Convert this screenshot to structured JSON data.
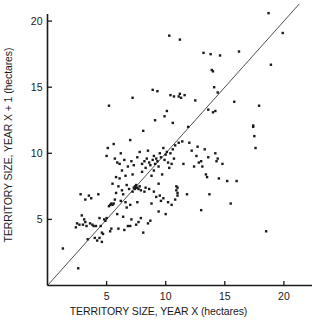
{
  "chart_data": {
    "type": "scatter",
    "title": "",
    "xlabel": "TERRITORY SIZE, YEAR X (hectares)",
    "ylabel": "TERRITORY SIZE, YEAR X + 1 (hectares)",
    "xlim": [
      0,
      22.8
    ],
    "ylim": [
      0,
      21.5
    ],
    "xticks": [
      5,
      10,
      15,
      20
    ],
    "yticks": [
      5,
      10,
      15,
      20
    ],
    "xtick_labels": [
      "5",
      "10",
      "15",
      "20"
    ],
    "ytick_labels": [
      "5",
      "10",
      "15",
      "20"
    ],
    "grid": false,
    "legend": false,
    "marker": {
      "shape": "square",
      "size_px": 2.4,
      "color": "#1a1a1a"
    },
    "reference_line": {
      "label": "y = x",
      "type": "identity",
      "from": [
        0,
        0
      ],
      "to": [
        21.3,
        21.3
      ],
      "color": "#3c3c3c",
      "width_px": 0.9
    },
    "axis_color": "#1a1a1a",
    "background": "#ffffff",
    "n_points": 205,
    "points": [
      [
        1.3,
        2.8
      ],
      [
        2.6,
        1.3
      ],
      [
        2.4,
        4.4
      ],
      [
        2.5,
        4.7
      ],
      [
        2.7,
        4.6
      ],
      [
        2.8,
        6.9
      ],
      [
        2.9,
        5.3
      ],
      [
        3.0,
        4.6
      ],
      [
        3.1,
        5.0
      ],
      [
        3.2,
        6.5
      ],
      [
        3.3,
        4.5
      ],
      [
        3.4,
        3.5
      ],
      [
        3.5,
        6.8
      ],
      [
        3.6,
        4.7
      ],
      [
        3.7,
        6.6
      ],
      [
        3.8,
        4.6
      ],
      [
        3.9,
        4.5
      ],
      [
        4.0,
        3.6
      ],
      [
        4.1,
        4.5
      ],
      [
        4.2,
        3.4
      ],
      [
        4.3,
        6.9
      ],
      [
        4.4,
        3.6
      ],
      [
        4.5,
        4.5
      ],
      [
        4.6,
        3.3
      ],
      [
        4.7,
        3.9
      ],
      [
        4.8,
        5.0
      ],
      [
        4.9,
        4.9
      ],
      [
        5.0,
        5.1
      ],
      [
        5.0,
        9.8
      ],
      [
        5.1,
        10.4
      ],
      [
        5.2,
        6.0
      ],
      [
        5.2,
        13.6
      ],
      [
        5.3,
        6.1
      ],
      [
        5.4,
        6.2
      ],
      [
        5.4,
        4.3
      ],
      [
        5.5,
        6.1
      ],
      [
        5.5,
        7.7
      ],
      [
        5.6,
        6.2
      ],
      [
        5.6,
        10.7
      ],
      [
        5.7,
        9.6
      ],
      [
        5.8,
        8.2
      ],
      [
        5.8,
        7.0
      ],
      [
        5.9,
        9.3
      ],
      [
        5.9,
        5.4
      ],
      [
        6.0,
        7.5
      ],
      [
        6.0,
        4.3
      ],
      [
        6.1,
        9.2
      ],
      [
        6.1,
        8.1
      ],
      [
        6.2,
        6.4
      ],
      [
        6.2,
        10.0
      ],
      [
        6.3,
        8.7
      ],
      [
        6.3,
        7.2
      ],
      [
        6.4,
        5.2
      ],
      [
        6.5,
        4.2
      ],
      [
        6.5,
        9.5
      ],
      [
        6.6,
        8.3
      ],
      [
        6.6,
        6.3
      ],
      [
        6.7,
        7.6
      ],
      [
        6.8,
        4.5
      ],
      [
        6.8,
        9.0
      ],
      [
        6.9,
        7.3
      ],
      [
        7.0,
        6.1
      ],
      [
        7.0,
        11.0
      ],
      [
        7.1,
        9.4
      ],
      [
        7.1,
        5.0
      ],
      [
        7.2,
        8.4
      ],
      [
        7.2,
        14.2
      ],
      [
        7.3,
        7.4
      ],
      [
        7.3,
        9.1
      ],
      [
        7.4,
        7.3
      ],
      [
        7.4,
        7.5
      ],
      [
        7.5,
        7.4
      ],
      [
        7.5,
        7.6
      ],
      [
        7.5,
        4.6
      ],
      [
        7.6,
        7.4
      ],
      [
        7.6,
        9.7
      ],
      [
        7.7,
        7.3
      ],
      [
        7.7,
        4.8
      ],
      [
        7.8,
        7.5
      ],
      [
        7.8,
        10.1
      ],
      [
        7.9,
        7.2
      ],
      [
        7.9,
        5.1
      ],
      [
        8.0,
        9.2
      ],
      [
        8.0,
        8.6
      ],
      [
        8.1,
        4.0
      ],
      [
        8.1,
        11.7
      ],
      [
        8.2,
        9.4
      ],
      [
        8.3,
        8.9
      ],
      [
        8.3,
        7.4
      ],
      [
        8.4,
        9.6
      ],
      [
        8.5,
        10.2
      ],
      [
        8.5,
        4.7
      ],
      [
        8.6,
        9.3
      ],
      [
        8.7,
        4.9
      ],
      [
        8.7,
        9.1
      ],
      [
        8.8,
        6.2
      ],
      [
        8.9,
        9.5
      ],
      [
        8.9,
        14.8
      ],
      [
        9.0,
        9.8
      ],
      [
        9.0,
        8.7
      ],
      [
        9.1,
        9.2
      ],
      [
        9.1,
        12.5
      ],
      [
        9.2,
        9.6
      ],
      [
        9.2,
        6.7
      ],
      [
        9.3,
        9.4
      ],
      [
        9.3,
        14.7
      ],
      [
        9.4,
        9.0
      ],
      [
        9.4,
        5.6
      ],
      [
        9.5,
        10.0
      ],
      [
        9.5,
        6.8
      ],
      [
        9.6,
        9.7
      ],
      [
        9.6,
        6.4
      ],
      [
        9.7,
        8.4
      ],
      [
        9.8,
        10.4
      ],
      [
        9.8,
        6.6
      ],
      [
        9.9,
        9.5
      ],
      [
        9.9,
        12.8
      ],
      [
        10.0,
        9.9
      ],
      [
        10.0,
        5.4
      ],
      [
        10.1,
        10.1
      ],
      [
        10.1,
        13.2
      ],
      [
        10.2,
        9.3
      ],
      [
        10.2,
        6.3
      ],
      [
        10.3,
        18.9
      ],
      [
        10.4,
        10.0
      ],
      [
        10.4,
        14.4
      ],
      [
        10.5,
        6.1
      ],
      [
        10.6,
        10.3
      ],
      [
        10.6,
        12.3
      ],
      [
        10.7,
        14.3
      ],
      [
        10.7,
        9.6
      ],
      [
        10.8,
        10.6
      ],
      [
        10.8,
        6.5
      ],
      [
        10.9,
        7.2
      ],
      [
        10.9,
        7.5
      ],
      [
        11.0,
        7.0
      ],
      [
        11.0,
        7.4
      ],
      [
        11.0,
        6.8
      ],
      [
        11.1,
        14.3
      ],
      [
        11.1,
        10.8
      ],
      [
        11.2,
        18.6
      ],
      [
        11.2,
        14.5
      ],
      [
        11.3,
        14.2
      ],
      [
        11.4,
        10.9
      ],
      [
        11.5,
        9.2
      ],
      [
        11.6,
        14.4
      ],
      [
        11.8,
        6.9
      ],
      [
        12.0,
        10.8
      ],
      [
        12.2,
        10.2
      ],
      [
        12.4,
        9.0
      ],
      [
        12.5,
        14.0
      ],
      [
        12.6,
        9.8
      ],
      [
        12.7,
        10.5
      ],
      [
        12.8,
        9.3
      ],
      [
        13.0,
        9.4
      ],
      [
        13.0,
        5.7
      ],
      [
        13.1,
        9.0
      ],
      [
        13.2,
        17.6
      ],
      [
        13.3,
        10.3
      ],
      [
        13.4,
        8.4
      ],
      [
        13.5,
        8.2
      ],
      [
        13.6,
        9.7
      ],
      [
        13.7,
        6.9
      ],
      [
        13.8,
        17.5
      ],
      [
        13.9,
        16.3
      ],
      [
        14.0,
        16.2
      ],
      [
        14.0,
        13.1
      ],
      [
        14.1,
        15.0
      ],
      [
        14.2,
        10.0
      ],
      [
        14.2,
        13.2
      ],
      [
        14.3,
        9.4
      ],
      [
        14.4,
        9.6
      ],
      [
        14.5,
        8.1
      ],
      [
        14.6,
        17.4
      ],
      [
        14.8,
        9.2
      ],
      [
        15.2,
        7.9
      ],
      [
        15.5,
        6.2
      ],
      [
        15.8,
        13.9
      ],
      [
        16.0,
        7.9
      ],
      [
        16.2,
        17.7
      ],
      [
        17.4,
        12.1
      ],
      [
        17.4,
        12.0
      ],
      [
        17.5,
        11.3
      ],
      [
        17.6,
        10.4
      ],
      [
        17.9,
        13.6
      ],
      [
        18.5,
        4.1
      ],
      [
        18.7,
        20.6
      ],
      [
        18.9,
        16.7
      ],
      [
        19.9,
        19.1
      ],
      [
        4.6,
        4.0
      ],
      [
        5.3,
        4.1
      ],
      [
        6.7,
        5.9
      ],
      [
        7.0,
        4.5
      ],
      [
        7.6,
        6.3
      ],
      [
        8.2,
        7.1
      ],
      [
        8.6,
        7.3
      ],
      [
        9.0,
        7.1
      ],
      [
        9.4,
        7.7
      ],
      [
        10.3,
        8.9
      ],
      [
        3.2,
        4.8
      ],
      [
        4.4,
        5.1
      ],
      [
        5.7,
        6.5
      ],
      [
        6.4,
        6.9
      ],
      [
        7.2,
        7.1
      ],
      [
        8.8,
        8.3
      ],
      [
        10.5,
        9.2
      ],
      [
        11.9,
        12.0
      ],
      [
        13.6,
        13.3
      ],
      [
        14.4,
        14.6
      ]
    ]
  }
}
